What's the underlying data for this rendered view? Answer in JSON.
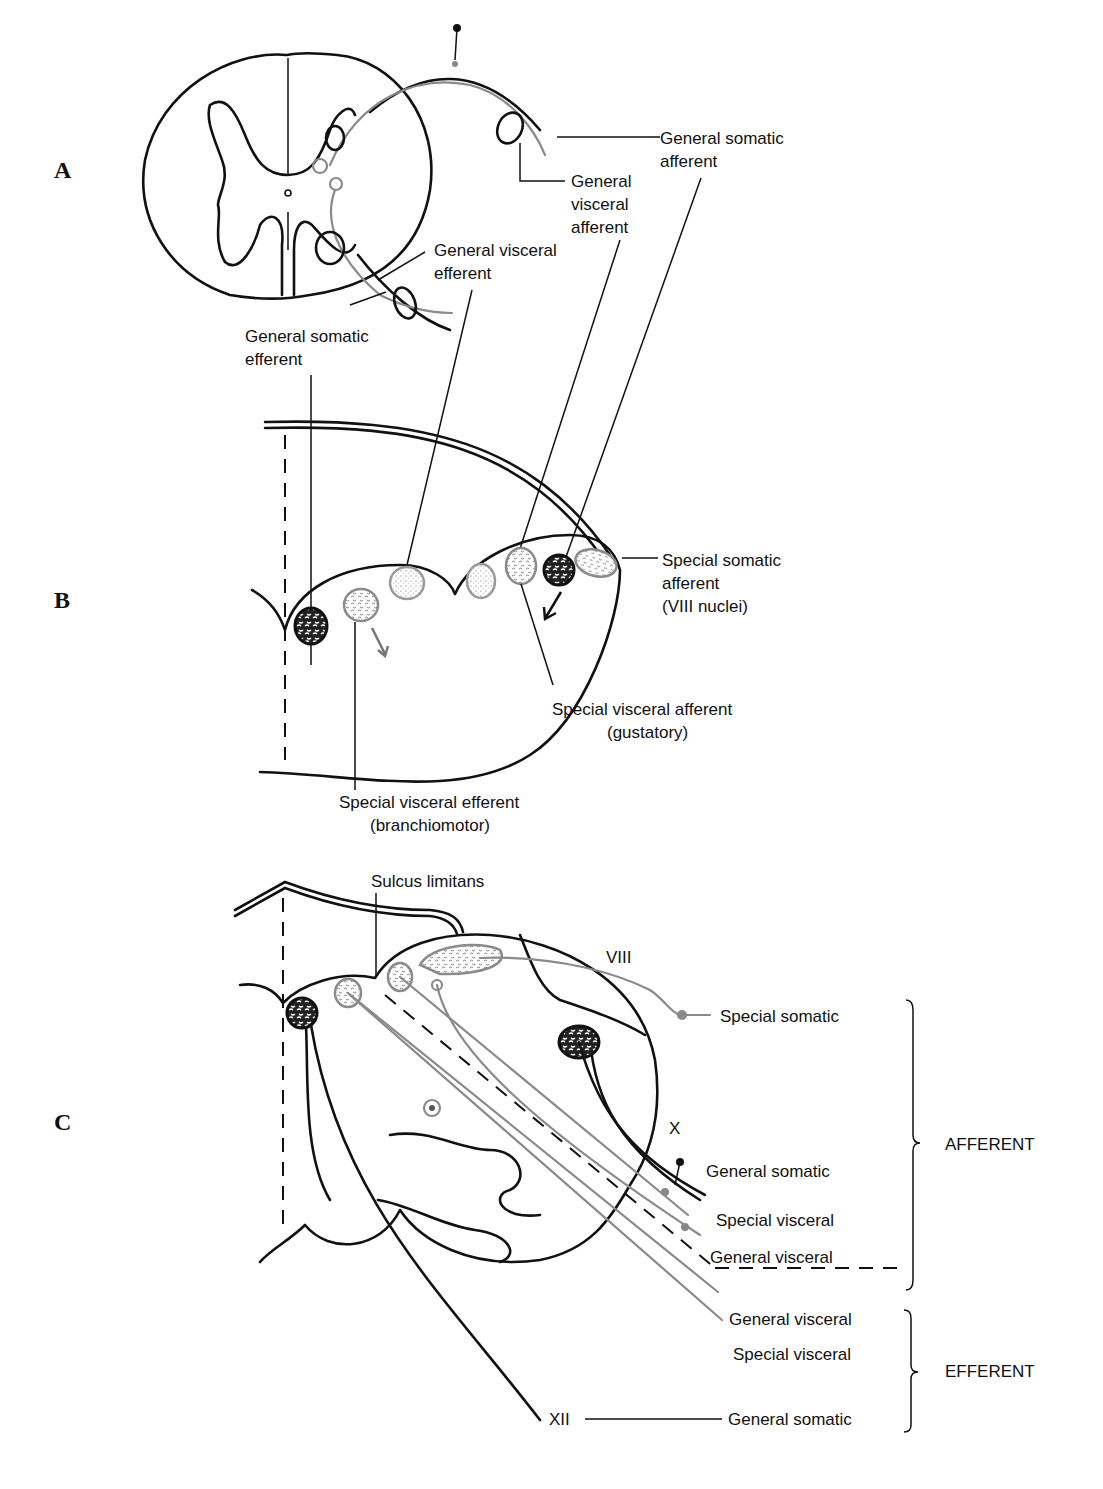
{
  "figure": {
    "panels": [
      {
        "id": "A",
        "label": "A",
        "subject": "spinal cord cross-section",
        "labels": {
          "gsa": [
            "General somatic",
            "afferent"
          ],
          "gva": [
            "General",
            "visceral",
            "afferent"
          ],
          "gve": [
            "General visceral",
            "efferent"
          ],
          "gse": [
            "General somatic",
            "efferent"
          ]
        }
      },
      {
        "id": "B",
        "label": "B",
        "subject": "developing brainstem section",
        "labels": {
          "ssa": [
            "Special somatic",
            "afferent",
            "(VIII nuclei)"
          ],
          "sva": [
            "Special visceral afferent",
            "(gustatory)"
          ],
          "sve": [
            "Special visceral efferent",
            "(branchiomotor)"
          ]
        }
      },
      {
        "id": "C",
        "label": "C",
        "subject": "adult medulla section",
        "labels": {
          "sulcus": "Sulcus limitans",
          "viii": "VIII",
          "x": "X",
          "xii": "XII",
          "afferent_items": [
            "Special somatic",
            "General somatic",
            "Special visceral",
            "General visceral"
          ],
          "efferent_items": [
            "General visceral",
            "Special visceral",
            "General somatic"
          ],
          "afferent_group": "AFFERENT",
          "efferent_group": "EFFERENT"
        }
      }
    ],
    "colors": {
      "line": "#111111",
      "gray_fiber": "#8a8a8a",
      "background": "#ffffff"
    }
  }
}
